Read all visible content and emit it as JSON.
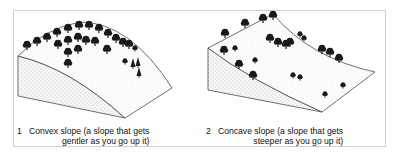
{
  "figure": {
    "panels": [
      {
        "number": "1",
        "title_line1": "Convex slope (a slope that gets",
        "title_line2": "gentler as you go up it)",
        "slope_type": "convex"
      },
      {
        "number": "2",
        "title_line1": "Concave slope (a slope that gets",
        "title_line2": "steeper as you go up it)",
        "slope_type": "concave"
      }
    ],
    "colors": {
      "line": "#333333",
      "tree": "#1a1a1a",
      "stipple": "#9a9a9a",
      "frame": "#cfcfcf"
    }
  }
}
